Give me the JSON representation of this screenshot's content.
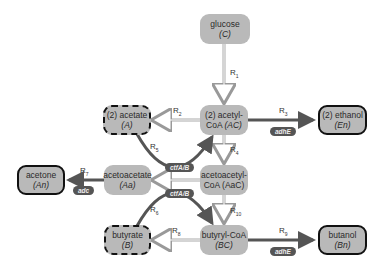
{
  "nodes": {
    "glucose": {
      "name": "glucose",
      "symbol": "(C)"
    },
    "acetyl_coa": {
      "name": "(2) acetyl-",
      "name2": "CoA",
      "symbol": "(AC)"
    },
    "acetate": {
      "name": "(2) acetate",
      "symbol": "(A)"
    },
    "ethanol": {
      "name": "(2) ethanol",
      "symbol": "(En)"
    },
    "acetone": {
      "name": "acetone",
      "symbol": "(An)"
    },
    "acetoacetate": {
      "name": "acetoacetate",
      "symbol": "(Aa)"
    },
    "acetoacetyl_coa": {
      "name": "acetoacetyl-",
      "name2": "CoA (AaC)"
    },
    "butyrate": {
      "name": "butyrate",
      "symbol": "(B)"
    },
    "butyryl_coa": {
      "name": "butyryl-CoA",
      "symbol": "(BC)"
    },
    "butanol": {
      "name": "butanol",
      "symbol": "(Bn)"
    }
  },
  "reactions": {
    "r_glucose": {
      "base": "R",
      "sub": "1"
    },
    "r_acetate": {
      "base": "R",
      "sub": "2"
    },
    "r_ethanol": {
      "base": "R",
      "sub": "3"
    },
    "r_acetoacetyl": {
      "base": "R",
      "sub": "4"
    },
    "r_acetate_uptake": {
      "base": "R",
      "sub": "5"
    },
    "r_acetone": {
      "base": "R",
      "sub": "7"
    },
    "r_butyrate_uptake": {
      "base": "R",
      "sub": "6"
    },
    "r_butyrate": {
      "base": "R",
      "sub": "8"
    },
    "r_butanol": {
      "base": "R",
      "sub": "9"
    },
    "r_butyryl": {
      "base": "R",
      "sub": "10"
    }
  },
  "genes": {
    "adhE_top": "adhE",
    "adhE_bottom": "adhE",
    "adc": "adc",
    "ctfAB_top": "ctfA/B",
    "ctfAB_bottom": "ctfA/B"
  },
  "colors": {
    "node_fill": "#b9b9b9",
    "gene_fill": "#555555",
    "thick_arrow": "#555555"
  }
}
